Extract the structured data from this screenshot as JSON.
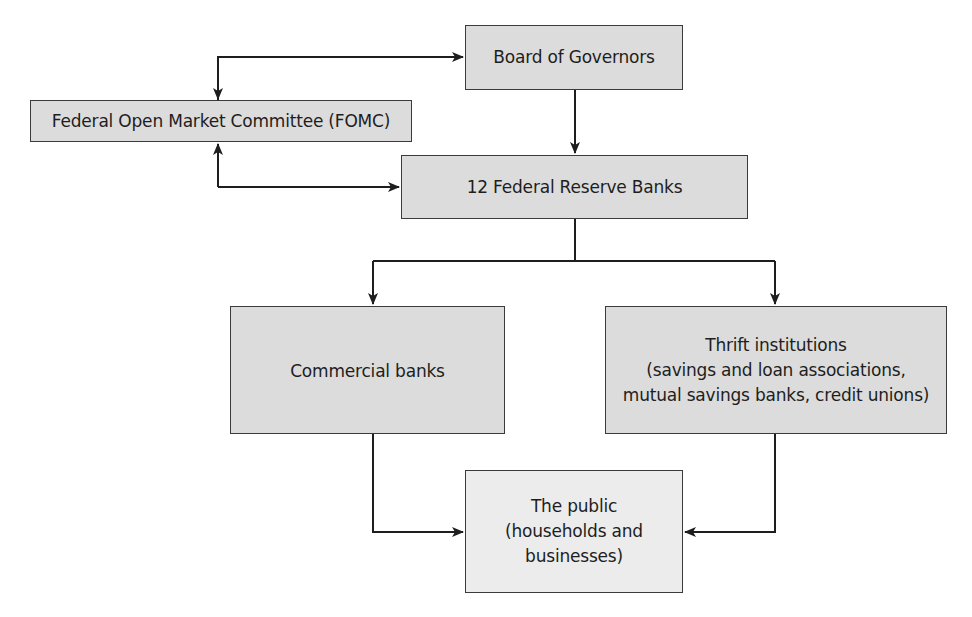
{
  "diagram": {
    "nodes": {
      "board": {
        "lines": [
          "Board of Governors"
        ]
      },
      "fomc": {
        "lines": [
          "Federal Open Market Committee (FOMC)"
        ]
      },
      "frb": {
        "lines": [
          "12 Federal Reserve Banks"
        ]
      },
      "commercial": {
        "lines": [
          "Commercial banks"
        ]
      },
      "thrift": {
        "lines": [
          "Thrift institutions",
          "(savings and loan associations,",
          "mutual savings banks, credit unions)"
        ]
      },
      "public": {
        "lines": [
          "The public",
          "(households and",
          "businesses)"
        ]
      }
    },
    "edges": [
      {
        "from": "fomc",
        "to": "board",
        "type": "bidirectional"
      },
      {
        "from": "fomc",
        "to": "frb",
        "type": "bidirectional"
      },
      {
        "from": "board",
        "to": "frb",
        "type": "directed"
      },
      {
        "from": "frb",
        "to": "commercial",
        "type": "directed"
      },
      {
        "from": "frb",
        "to": "thrift",
        "type": "directed"
      },
      {
        "from": "commercial",
        "to": "public",
        "type": "directed"
      },
      {
        "from": "thrift",
        "to": "public",
        "type": "directed"
      }
    ],
    "colors": {
      "box_fill": "#dcdcdc",
      "public_fill": "#ececec",
      "stroke": "#2a2a2a"
    }
  }
}
